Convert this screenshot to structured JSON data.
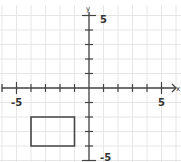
{
  "diagram": {
    "type": "coordinate-plane",
    "x_axis_label": "x",
    "y_axis_label": "y",
    "x_range": [
      -6,
      6
    ],
    "y_range": [
      -5,
      5
    ],
    "tick_labels": {
      "x_neg": "-5",
      "x_pos": "5",
      "y_pos": "5",
      "y_neg": "-5"
    },
    "shapes": [
      {
        "type": "rectangle",
        "vertices": [
          [
            -4,
            -2
          ],
          [
            -1,
            -2
          ],
          [
            -1,
            -4
          ],
          [
            -4,
            -4
          ]
        ],
        "stroke": "#444444"
      }
    ],
    "colors": {
      "axis": "#444444",
      "grid": "#e6e6e6",
      "shape": "#444444"
    }
  }
}
